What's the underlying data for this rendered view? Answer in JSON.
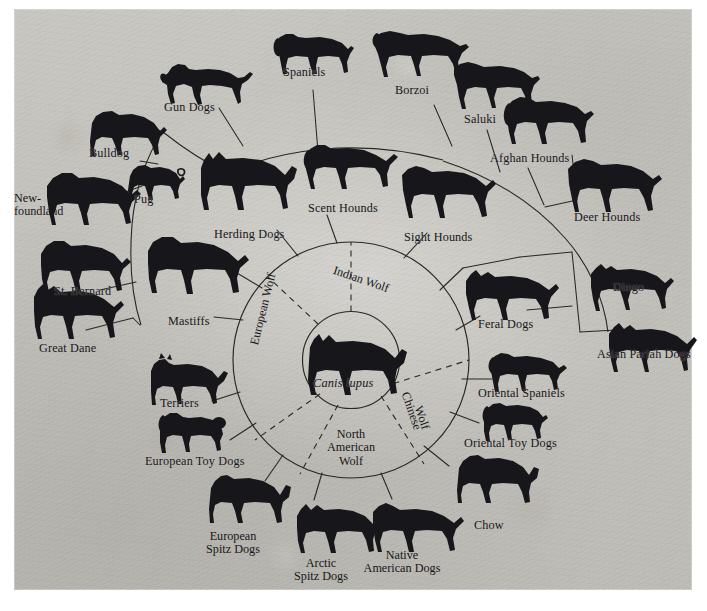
{
  "diagram": {
    "type": "radial-tree",
    "center": {
      "species_label": "Canis lupus",
      "animal": "wolf-illustration"
    },
    "background_color": "#c5c3bd",
    "ink_color": "#17161a",
    "ancestral_wolves": [
      {
        "id": "european",
        "label": "European Wolf",
        "orientation": "arc-left"
      },
      {
        "id": "indian",
        "label": "Indian Wolf",
        "orientation": "arc-top"
      },
      {
        "id": "chinese",
        "label": "Chinese\nWolf",
        "line1": "Chinese",
        "line2": "Wolf",
        "orientation": "arc-right"
      },
      {
        "id": "north-american",
        "line1": "North",
        "line2": "American",
        "line3": "Wolf",
        "orientation": "bottom-block"
      }
    ],
    "breed_groups": [
      {
        "id": "gun-dogs",
        "label": "Gun Dogs",
        "icon": "dog-pointer-icon"
      },
      {
        "id": "spaniels",
        "label": "Spaniels",
        "icon": "dog-spaniel-icon"
      },
      {
        "id": "borzoi",
        "label": "Borzoi",
        "icon": "dog-borzoi-icon"
      },
      {
        "id": "saluki",
        "label": "Saluki",
        "icon": "dog-saluki-icon"
      },
      {
        "id": "afghan-hounds",
        "label": "Afghan Hounds",
        "icon": "dog-afghan-icon"
      },
      {
        "id": "deer-hounds",
        "label": "Deer Hounds",
        "icon": "dog-deerhound-icon"
      },
      {
        "id": "dingo",
        "label": "Dingo",
        "icon": "dog-dingo-icon"
      },
      {
        "id": "asian-pariah-dogs",
        "label": "Asian Pariah Dogs",
        "icon": "dog-pariah-icon"
      },
      {
        "id": "feral-dogs",
        "label": "Feral Dogs",
        "icon": "dog-feral-icon"
      },
      {
        "id": "oriental-spaniels",
        "label": "Oriental Spaniels",
        "icon": "dog-oriental-spaniel-icon"
      },
      {
        "id": "oriental-toy-dogs",
        "label": "Oriental Toy Dogs",
        "icon": "dog-oriental-toy-icon"
      },
      {
        "id": "chow",
        "label": "Chow",
        "icon": "dog-chow-icon"
      },
      {
        "id": "native-american-dogs",
        "line1": "Native",
        "line2": "American Dogs",
        "label": "Native American Dogs",
        "icon": "dog-native-american-icon"
      },
      {
        "id": "arctic-spitz-dogs",
        "line1": "Arctic",
        "line2": "Spitz Dogs",
        "label": "Arctic Spitz Dogs",
        "icon": "dog-arctic-spitz-icon"
      },
      {
        "id": "european-spitz-dogs",
        "line1": "European",
        "line2": "Spitz Dogs",
        "label": "European Spitz Dogs",
        "icon": "dog-european-spitz-icon"
      },
      {
        "id": "european-toy-dogs",
        "label": "European Toy Dogs",
        "icon": "dog-poodle-icon"
      },
      {
        "id": "terriers",
        "label": "Terriers",
        "icon": "dog-terrier-icon"
      },
      {
        "id": "great-dane",
        "label": "Great Dane",
        "icon": "dog-great-dane-icon"
      },
      {
        "id": "st-bernard",
        "label": "St. Bernard",
        "icon": "dog-st-bernard-icon"
      },
      {
        "id": "newfoundland",
        "line1": "New-",
        "line2": "foundland",
        "label": "Newfoundland",
        "icon": "dog-newfoundland-icon"
      },
      {
        "id": "pug",
        "label": "Pug",
        "icon": "dog-pug-icon"
      },
      {
        "id": "bulldog",
        "label": "Bulldog",
        "icon": "dog-bulldog-icon"
      },
      {
        "id": "mastiffs",
        "label": "Mastiffs",
        "icon": "dog-mastiff-icon"
      },
      {
        "id": "herding-dogs",
        "label": "Herding Dogs",
        "icon": "dog-herding-icon"
      },
      {
        "id": "scent-hounds",
        "label": "Scent Hounds",
        "icon": "dog-scent-hound-icon"
      },
      {
        "id": "sight-hounds",
        "label": "Sight Hounds",
        "icon": "dog-sight-hound-icon"
      }
    ]
  }
}
